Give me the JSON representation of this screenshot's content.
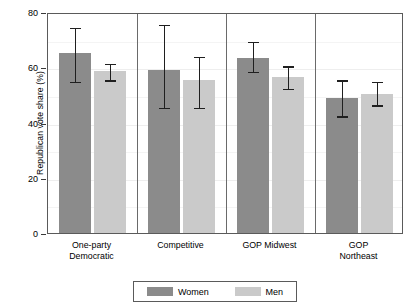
{
  "chart_data": {
    "type": "bar",
    "title": "",
    "xlabel": "",
    "ylabel": "Republican vote share (%)",
    "ylim": [
      0,
      80
    ],
    "yticks": [
      0,
      20,
      40,
      60,
      80
    ],
    "grid": true,
    "legend_position": "bottom",
    "categories": [
      "One-party Democratic",
      "Competitive",
      "GOP Midwest",
      "GOP Northeast"
    ],
    "category_lines": [
      [
        "One-party",
        "Democratic"
      ],
      [
        "Competitive",
        ""
      ],
      [
        "GOP Midwest",
        ""
      ],
      [
        "GOP",
        "Northeast"
      ]
    ],
    "series": [
      {
        "name": "Women",
        "color": "#8b8b8b",
        "values": [
          65.0,
          59.0,
          63.5,
          49.0
        ],
        "ci_low": [
          55.0,
          45.5,
          58.5,
          42.5
        ],
        "ci_high": [
          75.0,
          76.0,
          70.0,
          56.0
        ]
      },
      {
        "name": "Men",
        "color": "#cacaca",
        "values": [
          58.5,
          55.5,
          56.5,
          50.5
        ],
        "ci_low": [
          55.5,
          45.5,
          52.5,
          46.5
        ],
        "ci_high": [
          62.0,
          64.5,
          61.0,
          55.5
        ]
      }
    ]
  },
  "legend": {
    "items": [
      {
        "label": "Women",
        "color": "#8b8b8b"
      },
      {
        "label": "Men",
        "color": "#cacaca"
      }
    ]
  },
  "axis": {
    "y_tick_labels": [
      "80",
      "60",
      "40",
      "20",
      "0"
    ]
  }
}
